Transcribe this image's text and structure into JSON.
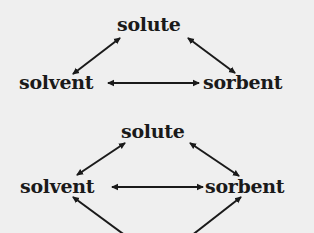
{
  "diagrams": [
    {
      "nodes": {
        "top": "solute",
        "left": "solvent",
        "right": "sorbent"
      },
      "edges": [
        {
          "from": "solute",
          "to": "solvent",
          "type": "bidirectional"
        },
        {
          "from": "solute",
          "to": "sorbent",
          "type": "bidirectional"
        },
        {
          "from": "solvent",
          "to": "sorbent",
          "type": "bidirectional"
        }
      ]
    },
    {
      "nodes": {
        "top": "solute",
        "left": "solvent",
        "right": "sorbent"
      },
      "edges": [
        {
          "from": "solute",
          "to": "solvent",
          "type": "bidirectional"
        },
        {
          "from": "solute",
          "to": "sorbent",
          "type": "bidirectional"
        },
        {
          "from": "solvent",
          "to": "sorbent",
          "type": "bidirectional"
        },
        {
          "from": "solvent",
          "to": "(cropped below)",
          "type": "bidirectional"
        },
        {
          "from": "sorbent",
          "to": "(cropped below)",
          "type": "bidirectional"
        }
      ]
    }
  ],
  "colors": {
    "background": "#efefef",
    "ink": "#1a1a1a"
  }
}
